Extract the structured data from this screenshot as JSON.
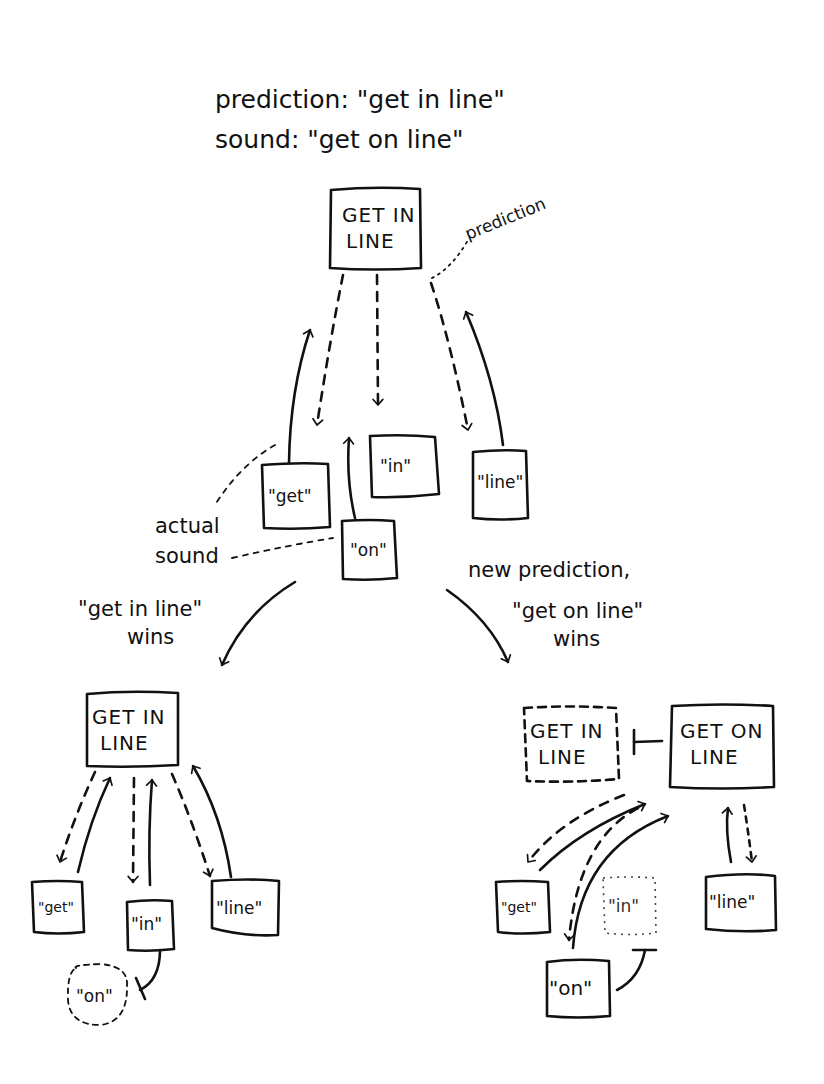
{
  "header": {
    "prediction_line": "prediction: \"get in line\"",
    "sound_line": "sound: \"get on line\""
  },
  "top": {
    "phrase_box": {
      "line1": "GET IN",
      "line2": "LINE"
    },
    "prediction_note": "prediction",
    "word_boxes": [
      "\"get\"",
      "\"in\"",
      "\"line\""
    ],
    "sound_box": "\"on\"",
    "actual_sound_note": {
      "line1": "actual",
      "line2": "sound"
    }
  },
  "branch_left": {
    "caption": {
      "line1": "\"get in line\"",
      "line2": "wins"
    },
    "phrase_box": {
      "line1": "GET IN",
      "line2": "LINE"
    },
    "word_boxes": [
      "\"get\"",
      "\"in\"",
      "\"line\""
    ],
    "inhibited_box": "\"on\""
  },
  "branch_right": {
    "caption": {
      "line0": "new prediction,",
      "line1": "\"get on line\"",
      "line2": "wins"
    },
    "inhibited_phrase_box": {
      "line1": "GET IN",
      "line2": "LINE"
    },
    "phrase_box": {
      "line1": "GET ON",
      "line2": "LINE"
    },
    "word_boxes": [
      "\"get\"",
      "\"line\""
    ],
    "inhibited_word_box": "\"in\"",
    "sound_box": "\"on\""
  }
}
